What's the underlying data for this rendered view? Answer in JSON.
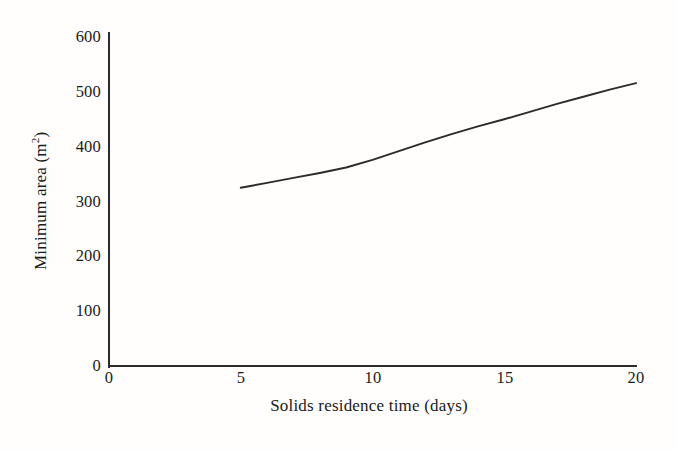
{
  "figure": {
    "background_color": "#fffefd",
    "line_color": "#2b2b2b"
  },
  "axes": {
    "x": {
      "label": "Solids residence time (days)",
      "ticks": [
        "0",
        "5",
        "10",
        "15",
        "20"
      ],
      "tick_values": [
        0,
        5,
        10,
        15,
        20
      ],
      "min": 0,
      "max": 20
    },
    "y": {
      "label_prefix": "Minimum area (m",
      "label_superscript": "2",
      "label_suffix": ")",
      "label_full": "Minimum area (m2)",
      "ticks": [
        "0",
        "100",
        "200",
        "300",
        "400",
        "500",
        "600"
      ],
      "tick_values": [
        0,
        100,
        200,
        300,
        400,
        500,
        600
      ],
      "min": 0,
      "max": 600
    }
  },
  "chart_data": {
    "type": "line",
    "title": "",
    "xlabel": "Solids residence time (days)",
    "ylabel": "Minimum area (m2)",
    "xlim": [
      0,
      20
    ],
    "ylim": [
      0,
      600
    ],
    "grid": false,
    "legend": null,
    "series": [
      {
        "name": "Minimum area",
        "x": [
          5,
          6,
          7,
          8,
          9,
          10,
          11,
          12,
          13,
          14,
          15,
          16,
          17,
          18,
          19,
          20
        ],
        "values": [
          325,
          334,
          343,
          352,
          362,
          376,
          392,
          408,
          423,
          437,
          450,
          464,
          478,
          491,
          504,
          516
        ]
      }
    ]
  }
}
